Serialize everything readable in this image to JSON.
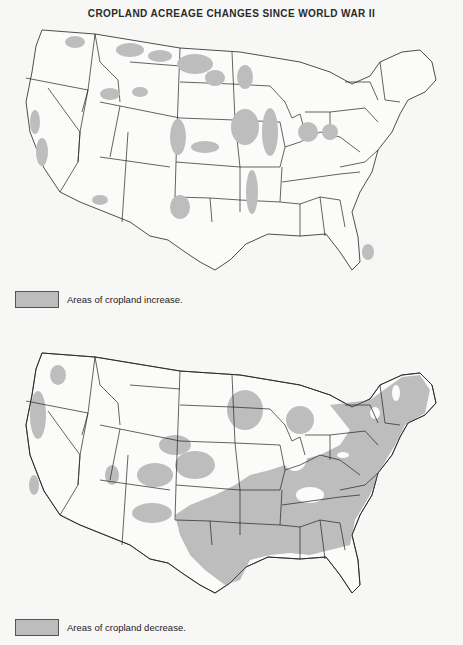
{
  "title": "CROPLAND ACREAGE CHANGES SINCE WORLD WAR II",
  "colors": {
    "shade": "#bdbdbd",
    "background": "#f7f7f5",
    "border": "#222222"
  },
  "maps": [
    {
      "id": "increase",
      "legend_label": "Areas of cropland increase.",
      "highlighted_regions": [
        "Northern Great Plains (Montana, North Dakota)",
        "Columbia Basin (Idaho, eastern Washington/Oregon)",
        "Central Valley (California)",
        "Southern High Plains (eastern Colorado, Texas Panhandle)",
        "Western Kansas and Nebraska",
        "Corn Belt (Iowa, Minnesota, Illinois, Indiana, Ohio)",
        "Mississippi Delta (Arkansas, Missouri Bootheel)",
        "Central Arizona",
        "Central Florida"
      ]
    },
    {
      "id": "decrease",
      "legend_label": "Areas of cropland decrease.",
      "highlighted_regions": [
        "New England and New York",
        "Pennsylvania",
        "Appalachia and Southeast (Kentucky, Tennessee, Virginia, Carolinas, Georgia, Alabama, Mississippi)",
        "Oklahoma and central/eastern Texas",
        "Missouri and Kansas",
        "Eastern Colorado and New Mexico",
        "Wisconsin and northern Minnesota",
        "Michigan",
        "Pacific coast (western Washington, Oregon, California)"
      ]
    }
  ]
}
